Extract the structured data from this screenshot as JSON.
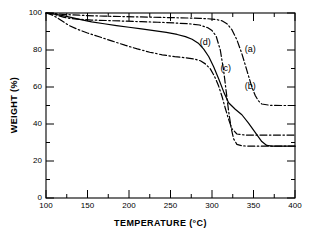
{
  "chart_data": {
    "type": "line",
    "title": "",
    "xlabel": "TEMPERATURE (°C)",
    "ylabel": "WEIGHT (%)",
    "xlim": [
      100,
      400
    ],
    "ylim": [
      0,
      100
    ],
    "xticks": [
      100,
      150,
      200,
      250,
      300,
      350,
      400
    ],
    "yticks": [
      0,
      20,
      40,
      60,
      80,
      100
    ],
    "xtick_labels": [
      "100",
      "150",
      "200",
      "250",
      "300",
      "350",
      "400"
    ],
    "ytick_labels": [
      "0",
      "20",
      "40",
      "60",
      "80",
      "100"
    ],
    "grid": false,
    "legend": "inline-annotations",
    "annotations": [
      {
        "text": "(a)",
        "x": 349,
        "y": 80
      },
      {
        "text": "(b)",
        "x": 349,
        "y": 60
      },
      {
        "text": "(d)",
        "x": 295,
        "y": 84
      },
      {
        "text": "(c)",
        "x": 320,
        "y": 70
      }
    ],
    "series": [
      {
        "name": "(a)",
        "label": "(a)",
        "style": "dash-dot",
        "color": "#000000",
        "final_weight": 50,
        "x": [
          100,
          110,
          120,
          130,
          140,
          150,
          170,
          190,
          210,
          230,
          250,
          270,
          285,
          295,
          305,
          312,
          318,
          324,
          330,
          336,
          342,
          348,
          352,
          356,
          360,
          370,
          385,
          400
        ],
        "y": [
          100,
          99.7,
          99.3,
          99.0,
          98.8,
          98.6,
          98.3,
          98.1,
          97.9,
          97.7,
          97.5,
          97.3,
          97.1,
          96.9,
          96.5,
          95.8,
          94.2,
          91.0,
          85.5,
          78.0,
          69.0,
          60.0,
          55.5,
          52.5,
          50.8,
          50.1,
          50.0,
          50.0
        ]
      },
      {
        "name": "(b)",
        "label": "(b)",
        "style": "dash-dot",
        "color": "#000000",
        "final_weight": 28,
        "x": [
          100,
          108,
          115,
          122,
          130,
          140,
          155,
          175,
          195,
          215,
          235,
          255,
          272,
          285,
          295,
          300,
          305,
          310,
          314,
          317,
          320,
          323,
          326,
          330,
          336,
          345,
          360,
          380,
          400
        ],
        "y": [
          100,
          99.5,
          98.6,
          97.6,
          97.0,
          96.6,
          96.2,
          95.9,
          95.6,
          95.3,
          95.0,
          94.6,
          94.2,
          93.5,
          92.0,
          90.5,
          87.5,
          80.0,
          69.0,
          58.0,
          47.0,
          38.0,
          32.0,
          29.0,
          28.2,
          28.0,
          28.0,
          28.0,
          28.0
        ]
      },
      {
        "name": "(c)",
        "label": "(c)",
        "style": "dash-dot",
        "color": "#000000",
        "final_weight": 34,
        "x": [
          100,
          107,
          113,
          120,
          128,
          138,
          150,
          165,
          180,
          195,
          210,
          225,
          240,
          255,
          268,
          278,
          286,
          292,
          298,
          303,
          308,
          312,
          316,
          320,
          324,
          330,
          340,
          360,
          380,
          400
        ],
        "y": [
          100,
          99.0,
          97.6,
          95.5,
          93.2,
          91.2,
          89.2,
          87.0,
          84.8,
          82.6,
          80.6,
          78.8,
          77.4,
          76.4,
          75.8,
          75.2,
          74.2,
          72.5,
          69.8,
          65.8,
          60.5,
          55.0,
          48.5,
          42.5,
          37.5,
          34.6,
          34.0,
          34.0,
          34.0,
          34.0
        ]
      },
      {
        "name": "(d)",
        "label": "(d)",
        "style": "solid",
        "color": "#000000",
        "final_weight": 28,
        "x": [
          100,
          110,
          120,
          130,
          142,
          155,
          170,
          185,
          200,
          215,
          230,
          245,
          258,
          268,
          276,
          284,
          290,
          296,
          302,
          308,
          314,
          320,
          328,
          336,
          344,
          352,
          360,
          366,
          372,
          385,
          400
        ],
        "y": [
          100,
          99.4,
          98.6,
          97.6,
          96.4,
          95.2,
          94.2,
          93.2,
          92.3,
          91.4,
          90.5,
          89.5,
          88.4,
          87.2,
          85.8,
          83.5,
          80.5,
          76.5,
          71.0,
          64.5,
          57.5,
          51.5,
          48.0,
          45.0,
          40.5,
          35.5,
          30.5,
          28.4,
          28.0,
          28.0,
          28.0
        ]
      }
    ]
  },
  "axes": {
    "x_title": "TEMPERATURE (°C)",
    "y_title": "WEIGHT (%)"
  }
}
